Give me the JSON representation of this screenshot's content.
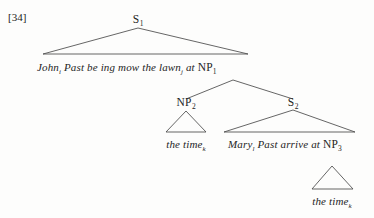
{
  "figure": {
    "example_number": "[34]",
    "background_color": "#fdfdfc",
    "line_color": "#4a4a4a"
  },
  "nodes": {
    "s1": {
      "label": "S",
      "subscript": "1"
    },
    "np1": {
      "label": "NP",
      "subscript": "1"
    },
    "np2": {
      "label": "NP",
      "subscript": "2"
    },
    "s2": {
      "label": "S",
      "subscript": "2"
    },
    "np3": {
      "label": "NP",
      "subscript": "3"
    }
  },
  "terminals": {
    "matrix_clause": {
      "words": "John",
      "sub1": "i",
      "mid": " Past be ing mow the lawn",
      "sub2": "j",
      "tail": " at ",
      "np_label": "NP",
      "np_subscript": "1"
    },
    "np2_expansion": {
      "text": "the time",
      "subscript": "k"
    },
    "s2_expansion": {
      "words": "Mary",
      "sub1": "l",
      "mid": " Past arrive at ",
      "np_label": "NP",
      "np_subscript": "3"
    },
    "np3_expansion": {
      "text": "the time",
      "subscript": "k"
    }
  }
}
